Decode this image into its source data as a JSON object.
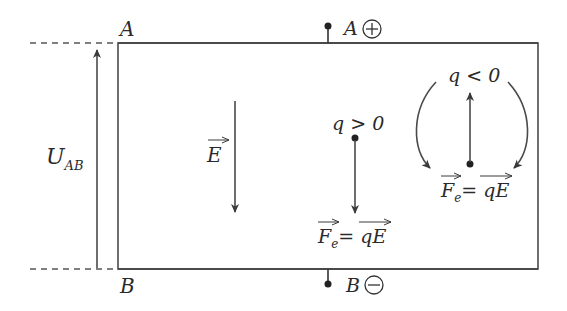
{
  "diagram": {
    "type": "uniform electric field between parallel plates",
    "plates": {
      "top": {
        "label": "A",
        "terminal_label": "A",
        "sign": "+"
      },
      "bottom": {
        "label": "B",
        "terminal_label": "B",
        "sign": "−"
      }
    },
    "voltage": {
      "symbol": "U",
      "subscript": "AB"
    },
    "field": {
      "symbol": "E",
      "direction": "down"
    },
    "positive_charge": {
      "condition": "q > 0",
      "force_lhs": "F",
      "force_sub": "e",
      "force_rhs": "= qE",
      "force_direction": "down"
    },
    "negative_charge": {
      "condition": "q < 0",
      "force_lhs": "F",
      "force_sub": "e",
      "force_rhs": "= qE",
      "force_direction": "up"
    },
    "colors": {
      "line": "#4a4a4a",
      "text": "#2a2a2a",
      "background": "#ffffff"
    }
  }
}
